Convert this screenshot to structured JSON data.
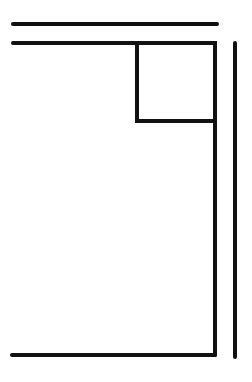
{
  "diagram": {
    "background": "#ffffff",
    "stroke_color": "#111111",
    "stroke_width": 4,
    "lines": [
      {
        "id": "top-line",
        "x1": 13,
        "y1": 24,
        "x2": 217,
        "y2": 24
      },
      {
        "id": "second-line",
        "x1": 13,
        "y1": 43,
        "x2": 215,
        "y2": 43
      },
      {
        "id": "main-right-edge",
        "x1": 215,
        "y1": 43,
        "x2": 215,
        "y2": 355
      },
      {
        "id": "bottom-line",
        "x1": 12,
        "y1": 355,
        "x2": 215,
        "y2": 355
      },
      {
        "id": "far-right-line",
        "x1": 235,
        "y1": 43,
        "x2": 235,
        "y2": 357
      }
    ],
    "inner_square": {
      "x": 137,
      "y": 43,
      "width": 78,
      "height": 78
    }
  }
}
